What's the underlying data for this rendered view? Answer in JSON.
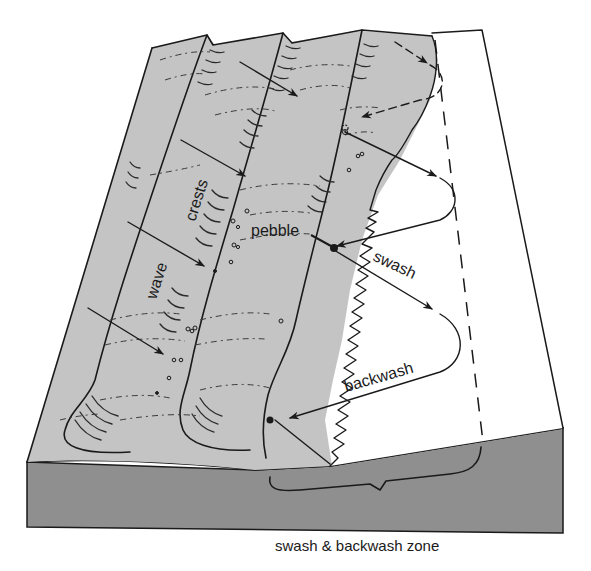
{
  "diagram": {
    "labels": {
      "wave": "wave",
      "crests": "crests",
      "pebble": "pebble",
      "swash": "swash",
      "backwash": "backwash",
      "zone": "swash & backwash zone"
    },
    "colors": {
      "sea_surface": "#c4c4c4",
      "block_side": "#8c8c8c",
      "beach": "#ffffff",
      "ink": "#1a1a1a"
    },
    "legend": [
      "solid arrows: wave direction",
      "zigzag path: pebble movement by swash and backwash"
    ]
  }
}
